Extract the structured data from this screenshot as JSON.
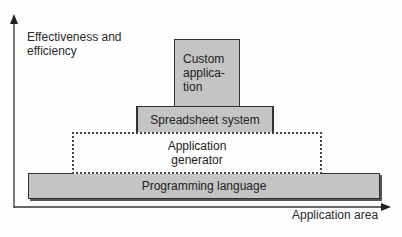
{
  "axes": {
    "y_label_line1": "Effectiveness and",
    "y_label_line2": "efficiency",
    "x_label": "Application area"
  },
  "layers": [
    {
      "id": "custom",
      "line1": "Custom",
      "line2": "applica-",
      "line3": "tion",
      "style": "solid",
      "fill": "#c4c4c4"
    },
    {
      "id": "spreadsheet",
      "label": "Spreadsheet system",
      "style": "solid",
      "fill": "#c4c4c4"
    },
    {
      "id": "generator",
      "line1": "Application",
      "line2": "generator",
      "style": "dotted",
      "fill": "#ffffff"
    },
    {
      "id": "programming",
      "label": "Programming language",
      "style": "solid",
      "fill": "#c4c4c4"
    }
  ]
}
